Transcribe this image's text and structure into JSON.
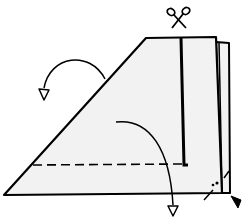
{
  "diagram": {
    "colors": {
      "paper": "#f2f2f2",
      "ink": "#000000",
      "background": "#ffffff"
    },
    "symbols": [
      {
        "name": "scissors-icon",
        "meaning": "cut along line"
      },
      {
        "name": "fold-arrow-left",
        "meaning": "fold flap back to the left"
      },
      {
        "name": "fold-arrow-down",
        "meaning": "fold flap down"
      },
      {
        "name": "dashed-fold-line",
        "meaning": "valley fold line"
      },
      {
        "name": "corner-pointer-icon",
        "meaning": "point to corner"
      }
    ]
  }
}
